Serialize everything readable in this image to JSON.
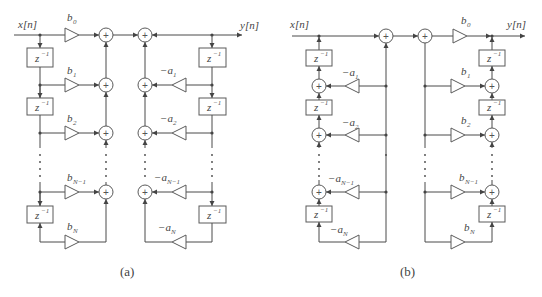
{
  "figure": {
    "panels": [
      {
        "caption": "(a)",
        "input_label": "x[n]",
        "output_label": "y[n]",
        "delay_label": "z",
        "delay_exp": "−1",
        "feedforward_gains": [
          {
            "base": "b",
            "sub": "0"
          },
          {
            "base": "b",
            "sub": "1"
          },
          {
            "base": "b",
            "sub": "2"
          },
          {
            "base": "b",
            "sub": "N−1"
          },
          {
            "base": "b",
            "sub": "N"
          }
        ],
        "feedback_gains": [
          {
            "base": "−a",
            "sub": "1"
          },
          {
            "base": "−a",
            "sub": "2"
          },
          {
            "base": "−a",
            "sub": "N−1"
          },
          {
            "base": "−a",
            "sub": "N"
          }
        ]
      },
      {
        "caption": "(b)",
        "input_label": "x[n]",
        "output_label": "y[n]",
        "delay_label": "z",
        "delay_exp": "−1",
        "feedforward_gains": [
          {
            "base": "b",
            "sub": "0"
          },
          {
            "base": "b",
            "sub": "1"
          },
          {
            "base": "b",
            "sub": "2"
          },
          {
            "base": "b",
            "sub": "N−1"
          },
          {
            "base": "b",
            "sub": "N"
          }
        ],
        "feedback_gains": [
          {
            "base": "−a",
            "sub": "1"
          },
          {
            "base": "−a",
            "sub": "2"
          },
          {
            "base": "−a",
            "sub": "N−1"
          },
          {
            "base": "−a",
            "sub": "N"
          }
        ]
      }
    ],
    "adder_symbol": "+"
  }
}
